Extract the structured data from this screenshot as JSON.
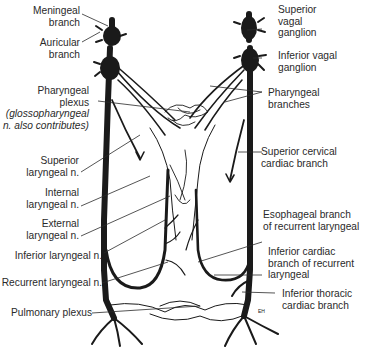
{
  "diagram": {
    "colors": {
      "nerve": "#1a1a1a",
      "text": "#2a2a2a",
      "background": "#ffffff"
    },
    "labels_left": [
      {
        "id": "meningeal",
        "lines": [
          "Meningeal",
          "branch"
        ]
      },
      {
        "id": "auricular",
        "lines": [
          "Auricular",
          "branch"
        ]
      },
      {
        "id": "pharyngeal-plexus",
        "lines": [
          "Pharyngeal",
          "plexus"
        ],
        "note": [
          "(glossopharyngeal",
          "n. also contributes)"
        ]
      },
      {
        "id": "superior-laryngeal",
        "lines": [
          "Superior",
          "laryngeal n."
        ]
      },
      {
        "id": "internal-laryngeal",
        "lines": [
          "Internal",
          "laryngeal n."
        ]
      },
      {
        "id": "external-laryngeal",
        "lines": [
          "External",
          "laryngeal n."
        ]
      },
      {
        "id": "inferior-laryngeal",
        "lines": [
          "Inferior laryngeal n."
        ]
      },
      {
        "id": "recurrent-laryngeal",
        "lines": [
          "Recurrent laryngeal n."
        ]
      },
      {
        "id": "pulmonary-plexus",
        "lines": [
          "Pulmonary plexus"
        ]
      }
    ],
    "labels_right": [
      {
        "id": "superior-vagal-ganglion",
        "lines": [
          "Superior",
          "vagal",
          "ganglion"
        ]
      },
      {
        "id": "inferior-vagal-ganglion",
        "lines": [
          "Inferior vagal",
          "ganglion"
        ]
      },
      {
        "id": "pharyngeal-branches",
        "lines": [
          "Pharyngeal",
          "branches"
        ]
      },
      {
        "id": "superior-cervical-cardiac",
        "lines": [
          "Superior cervical",
          "cardiac branch"
        ]
      },
      {
        "id": "esophageal-branch",
        "lines": [
          "Esophageal branch",
          "of recurrent laryngeal"
        ]
      },
      {
        "id": "inferior-cardiac",
        "lines": [
          "Inferior cardiac",
          "branch of recurrent",
          "laryngeal"
        ]
      },
      {
        "id": "inferior-thoracic-cardiac",
        "lines": [
          "Inferior thoracic",
          "cardiac branch"
        ]
      }
    ],
    "signature": "EH"
  }
}
